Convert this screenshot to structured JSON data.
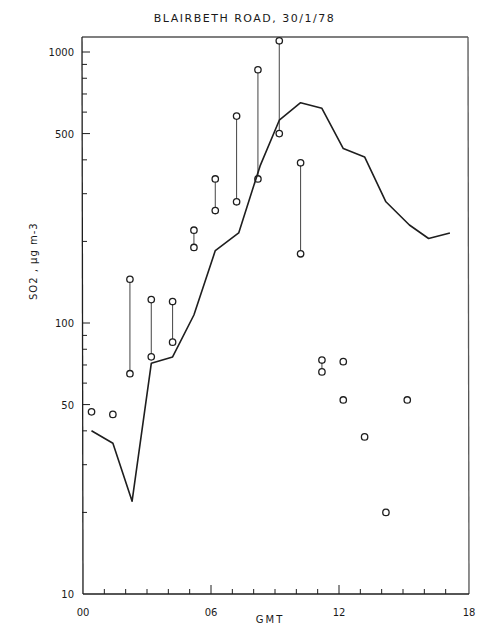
{
  "chart_data": {
    "type": "line",
    "title": "BLAIRBETH ROAD, 30/1/78",
    "xlabel": "GMT",
    "ylabel": "SO2 , µg m-3",
    "yscale": "log",
    "xlim": [
      0,
      18
    ],
    "ylim": [
      10,
      1200
    ],
    "x_ticks": [
      {
        "value": 0,
        "label": "00"
      },
      {
        "value": 6,
        "label": "06"
      },
      {
        "value": 12,
        "label": "12"
      },
      {
        "value": 18,
        "label": "18"
      }
    ],
    "y_ticks": [
      {
        "value": 10,
        "label": "10"
      },
      {
        "value": 50,
        "label": "50"
      },
      {
        "value": 100,
        "label": "100"
      },
      {
        "value": 500,
        "label": "500"
      },
      {
        "value": 1000,
        "label": "1000"
      }
    ],
    "grid": false,
    "legend": "none",
    "series": [
      {
        "name": "line",
        "type": "line",
        "x": [
          0.4,
          1.4,
          2.3,
          3.2,
          4.2,
          5.2,
          6.2,
          7.3,
          8.3,
          9.2,
          10.2,
          11.2,
          12.2,
          13.2,
          14.2,
          15.3,
          16.2,
          17.2
        ],
        "values": [
          40,
          36,
          22,
          71,
          75,
          107,
          185,
          215,
          380,
          560,
          650,
          620,
          440,
          410,
          280,
          230,
          205,
          215
        ]
      },
      {
        "name": "range bars",
        "type": "range",
        "x": [
          2.2,
          3.2,
          4.2,
          5.2,
          6.2,
          7.2,
          8.2,
          9.2,
          10.2,
          11.2
        ],
        "high": [
          145,
          122,
          120,
          220,
          340,
          580,
          860,
          1100,
          390,
          73
        ],
        "low": [
          65,
          75,
          85,
          190,
          260,
          280,
          340,
          500,
          180,
          66
        ]
      },
      {
        "name": "single points",
        "type": "scatter",
        "x": [
          0.4,
          1.4,
          12.2,
          12.2,
          13.2,
          14.2,
          15.2
        ],
        "values": [
          47,
          46,
          72,
          52,
          38,
          20,
          52
        ]
      }
    ]
  }
}
